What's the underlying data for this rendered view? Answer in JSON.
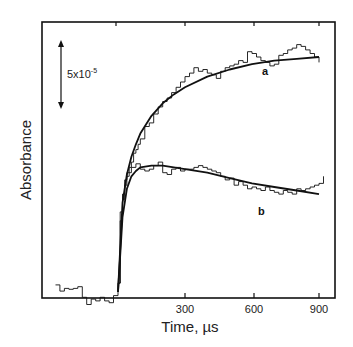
{
  "chart_data": {
    "type": "line",
    "title": "",
    "xlabel": "Time, µs",
    "ylabel": "Absorbance",
    "xlim": [
      -300,
      930
    ],
    "x_ticks": [
      300,
      600,
      900
    ],
    "x_tick_labels": [
      "300",
      "600",
      "900"
    ],
    "y_ticks": [],
    "grid": false,
    "legend": "none",
    "scale_bar": {
      "label": "5x10",
      "exponent": "-5",
      "value": 5e-05,
      "orientation": "vertical double arrow"
    },
    "annotations": [
      "a",
      "b"
    ],
    "series": [
      {
        "name": "a (noisy trace)",
        "style": "step",
        "x": [
          -280,
          -260,
          -240,
          -220,
          -200,
          -180,
          -160,
          -140,
          -120,
          -100,
          -80,
          -60,
          -40,
          -20,
          0,
          10,
          20,
          30,
          40,
          50,
          60,
          70,
          80,
          90,
          100,
          120,
          140,
          160,
          180,
          200,
          220,
          240,
          260,
          280,
          300,
          320,
          340,
          360,
          380,
          400,
          420,
          440,
          460,
          480,
          500,
          520,
          540,
          560,
          580,
          600,
          620,
          640,
          660,
          680,
          700,
          720,
          740,
          760,
          780,
          800,
          820,
          840,
          860,
          880,
          900
        ],
        "y": [
          0.4,
          0.05,
          0.2,
          0.15,
          0.2,
          0.3,
          -0.3,
          -0.7,
          -0.4,
          -0.5,
          -0.3,
          -0.5,
          -0.6,
          -0.2,
          0.5,
          4.5,
          5.2,
          6.0,
          6.5,
          7.0,
          7.3,
          7.8,
          8.0,
          8.3,
          8.6,
          9.3,
          9.5,
          10.0,
          10.4,
          10.7,
          10.9,
          11.2,
          11.5,
          11.8,
          12.1,
          12.3,
          12.6,
          12.4,
          12.5,
          12.3,
          12.2,
          12.0,
          12.4,
          12.6,
          12.7,
          12.8,
          13.0,
          12.9,
          13.5,
          13.4,
          13.2,
          13.0,
          12.9,
          12.7,
          12.8,
          13.3,
          13.4,
          13.6,
          13.7,
          13.9,
          13.8,
          13.6,
          13.4,
          13.2,
          12.9
        ]
      },
      {
        "name": "a (fit)",
        "style": "smooth",
        "x": [
          0,
          20,
          40,
          60,
          80,
          100,
          150,
          200,
          250,
          300,
          400,
          500,
          600,
          700,
          800,
          900
        ],
        "y": [
          0,
          5.0,
          6.6,
          7.6,
          8.3,
          8.9,
          9.9,
          10.6,
          11.1,
          11.5,
          12.1,
          12.5,
          12.8,
          13.0,
          13.1,
          13.2
        ]
      },
      {
        "name": "b (noisy trace)",
        "style": "step",
        "x": [
          0,
          10,
          20,
          30,
          40,
          60,
          80,
          100,
          120,
          140,
          160,
          180,
          200,
          220,
          240,
          260,
          280,
          300,
          320,
          340,
          360,
          380,
          400,
          420,
          440,
          460,
          480,
          500,
          520,
          540,
          560,
          580,
          600,
          620,
          640,
          660,
          680,
          700,
          720,
          740,
          760,
          780,
          800,
          820,
          840,
          860,
          880,
          900,
          920
        ],
        "y": [
          0.5,
          4.0,
          5.5,
          6.3,
          6.7,
          7.0,
          7.2,
          6.9,
          6.8,
          6.9,
          7.1,
          7.3,
          6.7,
          6.6,
          6.9,
          7.0,
          6.8,
          6.9,
          6.9,
          7.0,
          7.1,
          7.0,
          6.9,
          6.8,
          6.7,
          6.5,
          6.3,
          6.4,
          6.0,
          6.2,
          6.0,
          5.8,
          5.9,
          5.8,
          5.7,
          5.9,
          5.7,
          5.6,
          5.5,
          5.7,
          5.6,
          5.5,
          5.8,
          5.7,
          5.8,
          5.9,
          6.0,
          6.1,
          6.5
        ]
      },
      {
        "name": "b (fit)",
        "style": "smooth",
        "x": [
          0,
          20,
          40,
          60,
          80,
          100,
          150,
          200,
          250,
          300,
          400,
          500,
          600,
          700,
          800,
          900
        ],
        "y": [
          0,
          4.2,
          5.8,
          6.5,
          6.8,
          7.0,
          7.1,
          7.1,
          7.0,
          6.9,
          6.7,
          6.4,
          6.1,
          5.9,
          5.7,
          5.5
        ]
      }
    ]
  },
  "labels": {
    "x_axis": "Time, µs",
    "y_axis": "Absorbance",
    "scale": "5x10",
    "scale_exp": "-5",
    "series_a": "a",
    "series_b": "b",
    "tick_300": "300",
    "tick_600": "600",
    "tick_900": "900"
  }
}
